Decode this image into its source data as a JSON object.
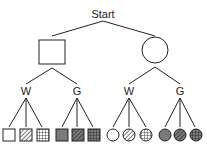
{
  "diagram": {
    "root": {
      "label": "Start"
    },
    "level1": [
      {
        "shape": "square",
        "children_labels": [
          "W",
          "G"
        ]
      },
      {
        "shape": "circle",
        "children_labels": [
          "W",
          "G"
        ]
      }
    ],
    "leaves": {
      "square_W": [
        "white",
        "hatched",
        "grid"
      ],
      "square_G": [
        "gray",
        "gray-hatched",
        "gray-grid"
      ],
      "circle_W": [
        "white",
        "hatched",
        "grid"
      ],
      "circle_G": [
        "gray",
        "gray-hatched",
        "gray-grid"
      ]
    },
    "colors": {
      "line": "#222222",
      "gray_fill": "#7a7a7a"
    }
  }
}
